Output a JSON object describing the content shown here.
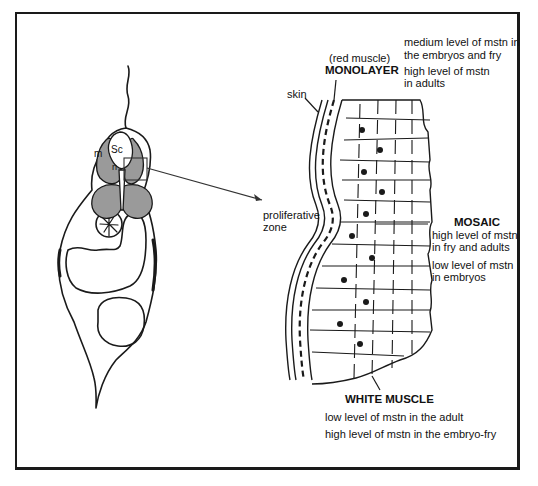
{
  "figure": {
    "cross_section_labels": {
      "spinal_cord": "Sc",
      "muscle": "m",
      "notochord": "n"
    },
    "muscle_labels": {
      "skin": "skin",
      "red_muscle_note": "(red muscle)",
      "monolayer_title": "MONOLAYER",
      "monolayer_line1": "medium level of mstn in",
      "monolayer_line2": "the embryos and fry",
      "monolayer_line3": "high level of mstn",
      "monolayer_line4": "in adults",
      "proliferative_line1": "proliferative",
      "proliferative_line2": "zone",
      "mosaic_title": "MOSAIC",
      "mosaic_line1": "high level of mstn",
      "mosaic_line2": "in fry and adults",
      "mosaic_line3": "low level of mstn",
      "mosaic_line4": "in embryos",
      "white_title": "WHITE MUSCLE",
      "white_line1": "low level of mstn in the adult",
      "white_line2": "high level of mstn in the embryo-fry"
    },
    "colors": {
      "muscle_fill": "#9a9a9a",
      "line": "#1a1a1a"
    }
  }
}
